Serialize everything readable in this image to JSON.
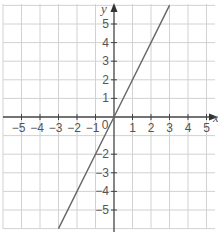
{
  "chart_data": {
    "type": "line",
    "title": "",
    "xlabel": "x",
    "ylabel": "y",
    "xlim": [
      -6,
      5.5
    ],
    "ylim": [
      -6,
      6
    ],
    "grid": true,
    "legend": null,
    "x_ticks": [
      -5,
      -4,
      -3,
      -2,
      -1,
      1,
      2,
      3,
      4,
      5
    ],
    "y_ticks": [
      5,
      4,
      3,
      2,
      1,
      -2,
      -3,
      -4,
      -5
    ],
    "origin_label": "0",
    "series": [
      {
        "name": "y = 2x",
        "equation": "y = 2x",
        "x": [
          -3,
          0,
          3
        ],
        "y": [
          -6,
          0,
          6
        ],
        "color": "#666666"
      }
    ],
    "colors": {
      "grid": "#d2d2d2",
      "axis": "#444444",
      "line": "#666666",
      "text": "#555555"
    }
  }
}
